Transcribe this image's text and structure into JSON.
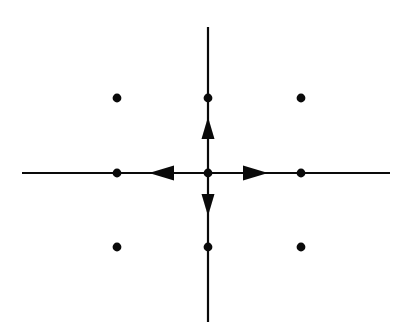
{
  "figure": {
    "type": "diagram",
    "width": 404,
    "height": 335,
    "background_color": "#ffffff",
    "ink_color": "#0a0a0a"
  },
  "canvas": {
    "origin": {
      "x": 208,
      "y": 173
    },
    "grid_spacing_x": 92,
    "grid_spacing_y": 74.5
  },
  "axes": {
    "horizontal": {
      "label": "horizontal-axis",
      "x1": 22,
      "y1": 173,
      "x2": 390,
      "y2": 173,
      "stroke_width": 2.2
    },
    "vertical": {
      "label": "vertical-axis",
      "x1": 208,
      "y1": 27,
      "x2": 208,
      "y2": 322,
      "stroke_width": 2.2
    }
  },
  "arrows": [
    {
      "name": "arrow-right",
      "direction": "right",
      "tip": {
        "x": 268,
        "y": 173
      },
      "base": {
        "x": 243,
        "y": 173
      },
      "half_width": 7.5
    },
    {
      "name": "arrow-left",
      "direction": "left",
      "tip": {
        "x": 149,
        "y": 173
      },
      "base": {
        "x": 174,
        "y": 173
      },
      "half_width": 7.5
    },
    {
      "name": "arrow-up",
      "direction": "up",
      "tip": {
        "x": 208,
        "y": 117
      },
      "base": {
        "x": 208,
        "y": 139
      },
      "half_width": 6.5
    },
    {
      "name": "arrow-down",
      "direction": "down",
      "tip": {
        "x": 208,
        "y": 216
      },
      "base": {
        "x": 208,
        "y": 194
      },
      "half_width": 6.5
    }
  ],
  "chart_data": {
    "type": "scatter",
    "xlabel": "",
    "ylabel": "",
    "grid": false,
    "legend": null,
    "xlim": [
      -2,
      2
    ],
    "ylim": [
      -2,
      2
    ],
    "lattice_points": [
      {
        "name": "point-upper-left",
        "lattice": [
          -1,
          1
        ],
        "px": 117,
        "py": 98,
        "radius": 4.4
      },
      {
        "name": "point-upper-center",
        "lattice": [
          0,
          1
        ],
        "px": 208,
        "py": 98,
        "radius": 4.4
      },
      {
        "name": "point-upper-right",
        "lattice": [
          1,
          1
        ],
        "px": 301,
        "py": 98,
        "radius": 4.4
      },
      {
        "name": "point-middle-left",
        "lattice": [
          -1,
          0
        ],
        "px": 117,
        "py": 173,
        "radius": 4.4
      },
      {
        "name": "point-origin",
        "lattice": [
          0,
          0
        ],
        "px": 208,
        "py": 173,
        "radius": 4.4
      },
      {
        "name": "point-middle-right",
        "lattice": [
          1,
          0
        ],
        "px": 301,
        "py": 173,
        "radius": 4.4
      },
      {
        "name": "point-lower-left",
        "lattice": [
          -1,
          -1
        ],
        "px": 117,
        "py": 247,
        "radius": 4.4
      },
      {
        "name": "point-lower-center",
        "lattice": [
          0,
          -1
        ],
        "px": 208,
        "py": 247,
        "radius": 4.4
      },
      {
        "name": "point-lower-right",
        "lattice": [
          1,
          -1
        ],
        "px": 301,
        "py": 247,
        "radius": 4.4
      }
    ],
    "annotations": [
      {
        "name": "basis-vector-e1",
        "direction": "right",
        "description": "arrowhead on positive horizontal axis"
      },
      {
        "name": "basis-vector-e1-negative",
        "direction": "left",
        "description": "arrowhead on negative horizontal axis"
      },
      {
        "name": "basis-vector-e2",
        "direction": "up",
        "description": "arrowhead on positive vertical axis"
      },
      {
        "name": "basis-vector-e2-negative",
        "direction": "down",
        "description": "arrowhead on negative vertical axis"
      }
    ]
  }
}
